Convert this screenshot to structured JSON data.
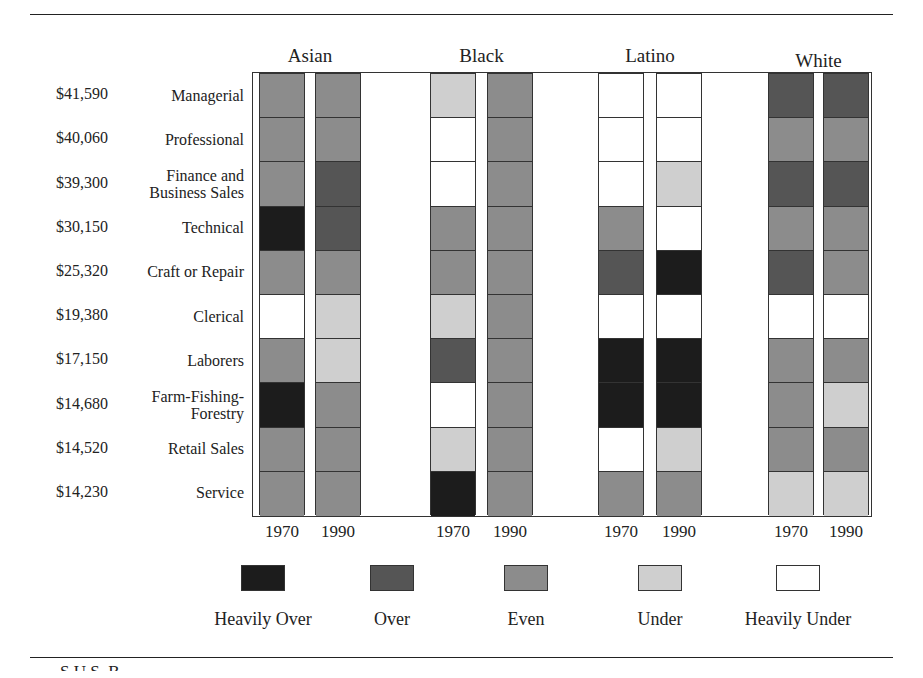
{
  "chart_data": {
    "type": "heatmap",
    "title": "",
    "groups": [
      "Asian",
      "Black",
      "Latino",
      "White"
    ],
    "years": [
      "1970",
      "1990"
    ],
    "occupations": [
      {
        "name": "Managerial",
        "income": "$41,590"
      },
      {
        "name": "Professional",
        "income": "$40,060"
      },
      {
        "name": "Finance and Business Sales",
        "income": "$39,300"
      },
      {
        "name": "Technical",
        "income": "$30,150"
      },
      {
        "name": "Craft or Repair",
        "income": "$25,320"
      },
      {
        "name": "Clerical",
        "income": "$19,380"
      },
      {
        "name": "Laborers",
        "income": "$17,150"
      },
      {
        "name": "Farm-Fishing-Forestry",
        "income": "$14,680"
      },
      {
        "name": "Retail Sales",
        "income": "$14,520"
      },
      {
        "name": "Service",
        "income": "$14,230"
      }
    ],
    "levels": [
      "Heavily Over",
      "Over",
      "Even",
      "Under",
      "Heavily Under"
    ],
    "level_colors": {
      "Heavily Over": "#1c1c1c",
      "Over": "#555555",
      "Even": "#8c8c8c",
      "Under": "#cfcfcf",
      "Heavily Under": "#ffffff"
    },
    "series": [
      {
        "name": "Asian 1970",
        "values": [
          "Even",
          "Even",
          "Even",
          "Heavily Over",
          "Even",
          "Heavily Under",
          "Even",
          "Heavily Over",
          "Even",
          "Even"
        ]
      },
      {
        "name": "Asian 1990",
        "values": [
          "Even",
          "Even",
          "Over",
          "Over",
          "Even",
          "Under",
          "Under",
          "Even",
          "Even",
          "Even"
        ]
      },
      {
        "name": "Black 1970",
        "values": [
          "Under",
          "Heavily Under",
          "Heavily Under",
          "Even",
          "Even",
          "Under",
          "Over",
          "Heavily Under",
          "Under",
          "Heavily Over"
        ]
      },
      {
        "name": "Black 1990",
        "values": [
          "Even",
          "Even",
          "Even",
          "Even",
          "Even",
          "Even",
          "Even",
          "Even",
          "Even",
          "Even"
        ]
      },
      {
        "name": "Latino 1970",
        "values": [
          "Heavily Under",
          "Heavily Under",
          "Heavily Under",
          "Even",
          "Over",
          "Heavily Under",
          "Heavily Over",
          "Heavily Over",
          "Heavily Under",
          "Even"
        ]
      },
      {
        "name": "Latino 1990",
        "values": [
          "Heavily Under",
          "Heavily Under",
          "Under",
          "Heavily Under",
          "Heavily Over",
          "Heavily Under",
          "Heavily Over",
          "Heavily Over",
          "Under",
          "Even"
        ]
      },
      {
        "name": "White 1970",
        "values": [
          "Over",
          "Even",
          "Over",
          "Even",
          "Over",
          "Heavily Under",
          "Even",
          "Even",
          "Even",
          "Under"
        ]
      },
      {
        "name": "White 1990",
        "values": [
          "Over",
          "Even",
          "Over",
          "Even",
          "Even",
          "Heavily Under",
          "Even",
          "Under",
          "Even",
          "Under"
        ]
      }
    ],
    "legend_position": "bottom"
  },
  "occupation_lines": [
    [
      "Managerial"
    ],
    [
      "Professional"
    ],
    [
      "Finance and",
      "Business Sales"
    ],
    [
      "Technical"
    ],
    [
      "Craft or Repair"
    ],
    [
      "Clerical"
    ],
    [
      "Laborers"
    ],
    [
      "Farm-Fishing-",
      "Forestry"
    ],
    [
      "Retail Sales"
    ],
    [
      "Service"
    ]
  ],
  "source_fragment": "S      U.S. B"
}
